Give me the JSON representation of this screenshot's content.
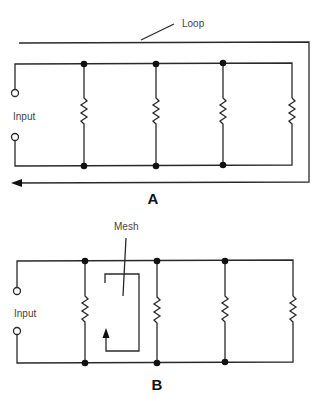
{
  "diagram_a": {
    "caption": "A",
    "input_label": "Input",
    "annotation_label": "Loop",
    "branches": 4,
    "junction_nodes": 6
  },
  "diagram_b": {
    "caption": "B",
    "input_label": "Input",
    "annotation_label": "Mesh",
    "branches": 4,
    "junction_nodes": 6
  },
  "colors": {
    "wire": "#2a2a2a",
    "label": "#444444",
    "background": "#ffffff"
  }
}
